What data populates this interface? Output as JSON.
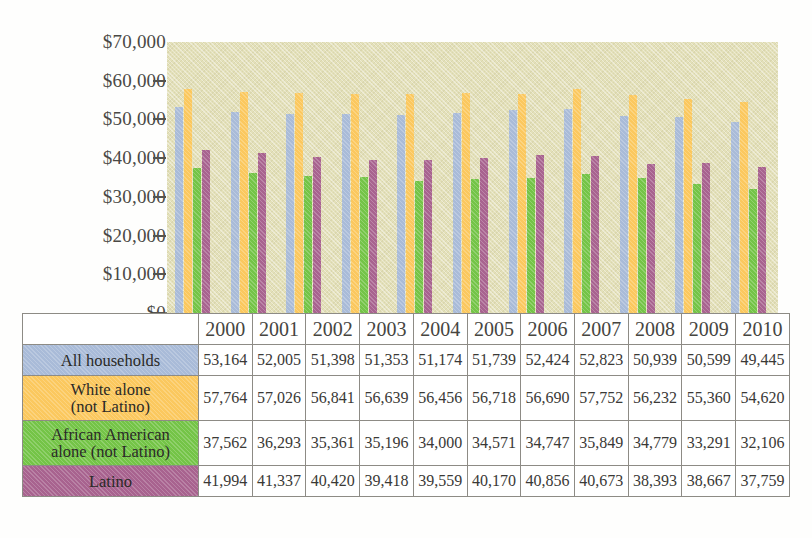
{
  "chart_data": {
    "type": "bar",
    "title": "",
    "xlabel": "",
    "ylabel": "",
    "ylim": [
      0,
      70000
    ],
    "grid": false,
    "legend_position": "table-row-headers",
    "y_ticks": [
      "$70,000",
      "$60,000",
      "$50,000",
      "$40,000",
      "$30,000",
      "$20,000",
      "$10,000",
      "$0"
    ],
    "y_tick_values": [
      70000,
      60000,
      50000,
      40000,
      30000,
      20000,
      10000,
      0
    ],
    "categories": [
      "2000",
      "2001",
      "2002",
      "2003",
      "2004",
      "2005",
      "2006",
      "2007",
      "2008",
      "2009",
      "2010"
    ],
    "series": [
      {
        "name": "All households",
        "color": "#a9bbd8",
        "values": [
          53164,
          52005,
          51398,
          51353,
          51174,
          51739,
          52424,
          52823,
          50939,
          50599,
          49445
        ],
        "labels": [
          "53,164",
          "52,005",
          "51,398",
          "51,353",
          "51,174",
          "51,739",
          "52,424",
          "52,823",
          "50,939",
          "50,599",
          "49,445"
        ]
      },
      {
        "name": "White alone (not Latino)",
        "color": "#fbc85e",
        "values": [
          57764,
          57026,
          56841,
          56639,
          56456,
          56718,
          56690,
          57752,
          56232,
          55360,
          54620
        ],
        "labels": [
          "57,764",
          "57,026",
          "56,841",
          "56,639",
          "56,456",
          "56,718",
          "56,690",
          "57,752",
          "56,232",
          "55,360",
          "54,620"
        ]
      },
      {
        "name": "African American alone (not Latino)",
        "color": "#74c447",
        "values": [
          37562,
          36293,
          35361,
          35196,
          34000,
          34571,
          34747,
          35849,
          34779,
          33291,
          32106
        ],
        "labels": [
          "37,562",
          "36,293",
          "35,361",
          "35,196",
          "34,000",
          "34,571",
          "34,747",
          "35,849",
          "34,779",
          "33,291",
          "32,106"
        ]
      },
      {
        "name": "Latino",
        "color": "#a8638f",
        "values": [
          41994,
          41337,
          40420,
          39418,
          39559,
          40170,
          40856,
          40673,
          38393,
          38667,
          37759
        ],
        "labels": [
          "41,994",
          "41,337",
          "40,420",
          "39,418",
          "39,559",
          "40,170",
          "40,856",
          "40,673",
          "38,393",
          "38,667",
          "37,759"
        ]
      }
    ]
  },
  "table": {
    "row_labels": [
      "All households",
      "White alone\n(not Latino)",
      "African American\nalone (not Latino)",
      "Latino"
    ],
    "row_label_lines": [
      [
        "All households"
      ],
      [
        "White alone",
        "(not Latino)"
      ],
      [
        "African American",
        "alone (not Latino)"
      ],
      [
        "Latino"
      ]
    ]
  },
  "colors": {
    "plot_background": "#e3e0b9",
    "all_households": "#a9bbd8",
    "white_alone": "#fbc85e",
    "african_american": "#74c447",
    "latino": "#a8638f",
    "axis": "#55544f",
    "table_border": "#8d8b85"
  }
}
